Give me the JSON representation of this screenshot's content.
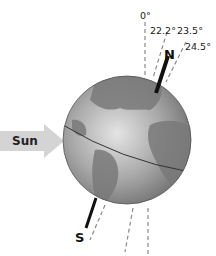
{
  "diagram": {
    "sun_label": "Sun",
    "north_label": "N",
    "south_label": "S",
    "angle_labels": [
      "0°",
      "22.2°",
      "23.5°",
      "24.5°"
    ],
    "colors": {
      "arrow": "#c8c8c8",
      "globe_light": "#d6d6d6",
      "globe_dark": "#6e6e6e",
      "axis": "#111111",
      "dashed": "#999999"
    }
  }
}
